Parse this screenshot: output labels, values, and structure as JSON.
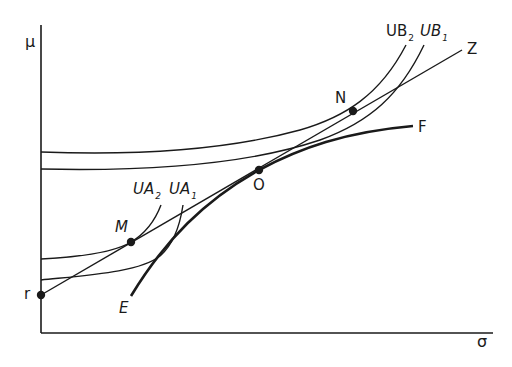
{
  "diagram": {
    "axes": {
      "y_label": "μ",
      "x_label": "σ"
    },
    "points": {
      "r": "r",
      "M": "M",
      "O": "O",
      "N": "N"
    },
    "line_labels": {
      "Z": "Z",
      "F": "F",
      "E": "E"
    },
    "curves": {
      "UB2": {
        "base": "UB",
        "sub": "2",
        "italic": false
      },
      "UB1": {
        "base": "UB",
        "sub": "1",
        "italic": true
      },
      "UA2": {
        "base": "UA",
        "sub": "2",
        "italic": true
      },
      "UA1": {
        "base": "UA",
        "sub": "1",
        "italic": true
      }
    },
    "colors": {
      "ink": "#1a1a1a",
      "background": "#ffffff"
    }
  }
}
